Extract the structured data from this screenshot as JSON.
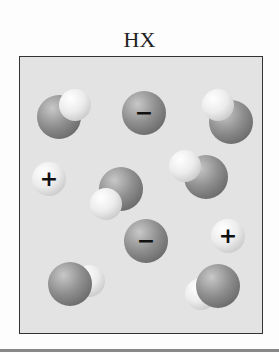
{
  "figure": {
    "title": "HX",
    "legend_description": "Molecular-level view of HX in solution",
    "particles": [
      {
        "type": "HX-molecule",
        "x_center": 58,
        "y_center": 116,
        "h_position": "upper-right"
      },
      {
        "type": "X-anion",
        "x_center": 143,
        "y_center": 112,
        "charge": "−"
      },
      {
        "type": "HX-molecule",
        "x_center": 225,
        "y_center": 114,
        "h_position": "upper-left"
      },
      {
        "type": "H-cation",
        "x_center": 48,
        "y_center": 178,
        "charge": "+"
      },
      {
        "type": "HX-molecule",
        "x_center": 117,
        "y_center": 190,
        "h_position": "lower-left"
      },
      {
        "type": "HX-molecule",
        "x_center": 194,
        "y_center": 172,
        "h_position": "upper-left"
      },
      {
        "type": "X-anion",
        "x_center": 145,
        "y_center": 240,
        "charge": "−"
      },
      {
        "type": "H-cation",
        "x_center": 227,
        "y_center": 235,
        "charge": "+"
      },
      {
        "type": "HX-molecule",
        "x_center": 72,
        "y_center": 283,
        "h_position": "right"
      },
      {
        "type": "HX-molecule",
        "x_center": 215,
        "y_center": 287,
        "h_position": "lower-left"
      }
    ],
    "colors": {
      "x_atom": "#8e8e8e",
      "h_atom": "#ececec",
      "box_fill": "#e3e3e3",
      "box_border": "#333333"
    }
  }
}
